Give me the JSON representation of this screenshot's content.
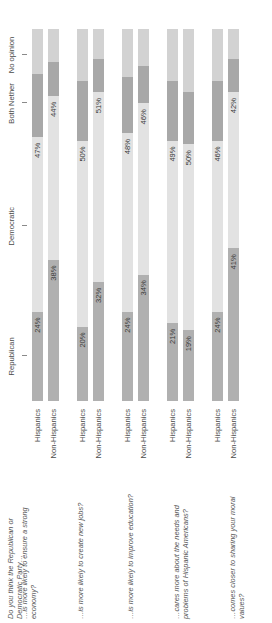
{
  "chart_data": {
    "type": "bar",
    "orientation": "horizontal",
    "stacked": true,
    "title": "",
    "xlabel": "",
    "ylabel": "",
    "xlim": [
      0,
      100
    ],
    "grid": false,
    "legend_position": "top",
    "categories_axis_labels": [
      "Republican",
      "Democratic",
      "Both Nether",
      "No opinion"
    ],
    "series": [
      {
        "name": "Republican",
        "color": "#b0b0b0"
      },
      {
        "name": "Democratic",
        "color": "#e2e2e2"
      },
      {
        "name": "Both Nether",
        "color": "#a8a8a8"
      },
      {
        "name": "No opinion",
        "color": "#d2d2d2"
      }
    ],
    "questions": [
      {
        "text": "Do you think the Republican or Democratic Party…",
        "bars": [
          {
            "group": "Hispanics",
            "republican": 24,
            "democratic": 47,
            "both_neither": 17,
            "no_opinion": 12,
            "republican_label": "24%",
            "democratic_label": "47%"
          },
          {
            "group": "Non-Hispanics",
            "republican": 38,
            "democratic": 44,
            "both_neither": 9,
            "no_opinion": 9,
            "republican_label": "38%",
            "democratic_label": "44%"
          }
        ]
      },
      {
        "text": "…is more likely to ensure a strong economy?",
        "bars": []
      },
      {
        "text": "…is more likely to create new jobs?",
        "bars": [
          {
            "group": "Hispanics",
            "republican": 20,
            "democratic": 50,
            "both_neither": 16,
            "no_opinion": 14,
            "republican_label": "20%",
            "democratic_label": "50%"
          },
          {
            "group": "Non-Hispanics",
            "republican": 32,
            "democratic": 51,
            "both_neither": 9,
            "no_opinion": 8,
            "republican_label": "32%",
            "democratic_label": "51%"
          }
        ]
      },
      {
        "text": "…is more likely to improve education?",
        "bars": [
          {
            "group": "Hispanics",
            "republican": 24,
            "democratic": 48,
            "both_neither": 15,
            "no_opinion": 13,
            "republican_label": "24%",
            "democratic_label": "48%"
          },
          {
            "group": "Non-Hispanics",
            "republican": 34,
            "democratic": 46,
            "both_neither": 10,
            "no_opinion": 10,
            "republican_label": "34%",
            "democratic_label": "46%"
          }
        ]
      },
      {
        "text": "…cares more about the needs and problems of Hispanic Americans?",
        "bars": [
          {
            "group": "Hispanics",
            "republican": 21,
            "democratic": 49,
            "both_neither": 16,
            "no_opinion": 14,
            "republican_label": "21%",
            "democratic_label": "49%"
          },
          {
            "group": "Non-Hispanics",
            "republican": 19,
            "democratic": 50,
            "both_neither": 14,
            "no_opinion": 17,
            "republican_label": "19%",
            "democratic_label": "50%"
          }
        ]
      },
      {
        "text": "…comes closer to sharing your moral values?",
        "bars": [
          {
            "group": "Hispanics",
            "republican": 24,
            "democratic": 46,
            "both_neither": 16,
            "no_opinion": 14,
            "republican_label": "24%",
            "democratic_label": "46%"
          },
          {
            "group": "Non-Hispanics",
            "republican": 41,
            "democratic": 42,
            "both_neither": 9,
            "no_opinion": 8,
            "republican_label": "41%",
            "democratic_label": "42%"
          }
        ]
      }
    ]
  },
  "question_texts": [
    "Do you think the Republican or Democratic Party…",
    "…is more likely to ensure a strong economy?",
    "…is more likely to create new jobs?",
    "…is more likely to improve education?",
    "…cares more about the needs and problems of Hispanic Americans?",
    "…comes closer to sharing your moral values?"
  ],
  "group_names": [
    "Hispanics",
    "Non-Hispanics"
  ],
  "axis_labels": [
    "Republican",
    "Democratic",
    "Both Nether",
    "No opinion"
  ]
}
